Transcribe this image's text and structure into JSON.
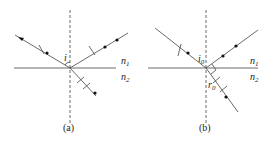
{
  "panels": [
    {
      "id": "a",
      "caption": "(a)",
      "angle_label": "i",
      "n1": "n",
      "n1_sub": "1",
      "n2": "n",
      "n2_sub": "2"
    },
    {
      "id": "b",
      "caption": "(b)",
      "angle_label": "i",
      "angle_sub": "0",
      "refr_label": "r",
      "refr_sub": "0",
      "n1": "n",
      "n1_sub": "1",
      "n2": "n",
      "n2_sub": "2"
    }
  ],
  "colors": {
    "line": "#444444",
    "dot": "#111111"
  }
}
